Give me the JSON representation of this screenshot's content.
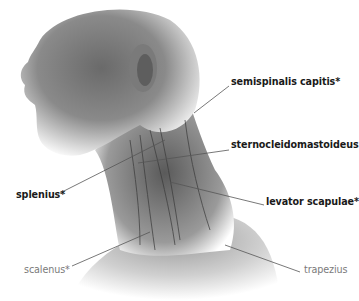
{
  "figure": {
    "labels": [
      {
        "id": "semispinalis",
        "text": "semispinalis capitis*",
        "style": "bold",
        "x": 231,
        "y": 80,
        "line": [
          229,
          86,
          194,
          113
        ]
      },
      {
        "id": "sternocleido",
        "text": "sternocleidomastoideus",
        "style": "bold",
        "x": 231,
        "y": 143,
        "line": [
          229,
          150,
          138,
          163
        ]
      },
      {
        "id": "splenius",
        "text": "splenius*",
        "style": "bold",
        "x": 16,
        "y": 193,
        "line": [
          60,
          193,
          165,
          140
        ]
      },
      {
        "id": "levator",
        "text": "levator scapulae*",
        "style": "bold",
        "x": 266,
        "y": 200,
        "line": [
          264,
          205,
          170,
          182
        ]
      },
      {
        "id": "scalenus",
        "text": "scalenus*",
        "style": "light",
        "x": 24,
        "y": 268,
        "line": [
          72,
          266,
          150,
          232
        ]
      },
      {
        "id": "trapezius",
        "text": "trapezius",
        "style": "light",
        "x": 304,
        "y": 268,
        "line": [
          300,
          272,
          225,
          245
        ]
      }
    ]
  }
}
